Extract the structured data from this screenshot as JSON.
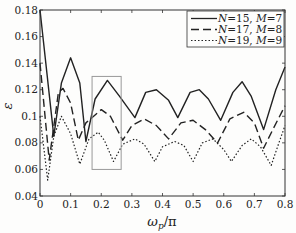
{
  "chart_data": {
    "type": "line",
    "title": "",
    "xlabel": "ω_p/π",
    "ylabel": "ε",
    "xlim": [
      0,
      0.8
    ],
    "ylim": [
      0.04,
      0.18
    ],
    "xticks": [
      0,
      0.1,
      0.2,
      0.3,
      0.4,
      0.5,
      0.6,
      0.7,
      0.8
    ],
    "xtick_labels": [
      "0",
      "0.1",
      "0.2",
      "0.3",
      "0.4",
      "0.5",
      "0.6",
      "0.7",
      "0.8"
    ],
    "yticks": [
      0.04,
      0.06,
      0.08,
      0.1,
      0.12,
      0.14,
      0.16,
      0.18
    ],
    "ytick_labels": [
      "0.04",
      "0.06",
      "0.08",
      "0.1",
      "0.12",
      "0.14",
      "0.16",
      "0.18"
    ],
    "grid": false,
    "legend_position": "upper right",
    "series": [
      {
        "name": "N=15, M=7",
        "style": "solid",
        "color": "#222222",
        "points": [
          [
            0,
            0.18
          ],
          [
            0.045,
            0.085
          ],
          [
            0.07,
            0.125
          ],
          [
            0.1,
            0.144
          ],
          [
            0.13,
            0.125
          ],
          [
            0.15,
            0.081
          ],
          [
            0.18,
            0.113
          ],
          [
            0.22,
            0.127
          ],
          [
            0.26,
            0.115
          ],
          [
            0.31,
            0.099
          ],
          [
            0.345,
            0.118
          ],
          [
            0.38,
            0.12
          ],
          [
            0.42,
            0.112
          ],
          [
            0.45,
            0.099
          ],
          [
            0.49,
            0.118
          ],
          [
            0.52,
            0.12
          ],
          [
            0.55,
            0.113
          ],
          [
            0.59,
            0.097
          ],
          [
            0.63,
            0.118
          ],
          [
            0.66,
            0.126
          ],
          [
            0.69,
            0.115
          ],
          [
            0.73,
            0.09
          ],
          [
            0.77,
            0.12
          ],
          [
            0.8,
            0.137
          ]
        ]
      },
      {
        "name": "N=17, M=8",
        "style": "dashed",
        "color": "#222222",
        "points": [
          [
            0,
            0.14
          ],
          [
            0.03,
            0.067
          ],
          [
            0.06,
            0.118
          ],
          [
            0.075,
            0.121
          ],
          [
            0.1,
            0.11
          ],
          [
            0.125,
            0.082
          ],
          [
            0.15,
            0.095
          ],
          [
            0.2,
            0.105
          ],
          [
            0.23,
            0.1
          ],
          [
            0.27,
            0.082
          ],
          [
            0.3,
            0.093
          ],
          [
            0.34,
            0.098
          ],
          [
            0.38,
            0.093
          ],
          [
            0.42,
            0.083
          ],
          [
            0.46,
            0.095
          ],
          [
            0.5,
            0.097
          ],
          [
            0.54,
            0.09
          ],
          [
            0.58,
            0.08
          ],
          [
            0.62,
            0.098
          ],
          [
            0.665,
            0.103
          ],
          [
            0.7,
            0.095
          ],
          [
            0.73,
            0.076
          ],
          [
            0.76,
            0.09
          ],
          [
            0.8,
            0.108
          ]
        ]
      },
      {
        "name": "N=19, M=9",
        "style": "dotted",
        "color": "#222222",
        "points": [
          [
            0,
            0.1
          ],
          [
            0.025,
            0.052
          ],
          [
            0.045,
            0.085
          ],
          [
            0.07,
            0.1
          ],
          [
            0.1,
            0.087
          ],
          [
            0.13,
            0.064
          ],
          [
            0.16,
            0.083
          ],
          [
            0.19,
            0.088
          ],
          [
            0.21,
            0.082
          ],
          [
            0.24,
            0.066
          ],
          [
            0.27,
            0.079
          ],
          [
            0.31,
            0.083
          ],
          [
            0.34,
            0.079
          ],
          [
            0.375,
            0.066
          ],
          [
            0.4,
            0.077
          ],
          [
            0.44,
            0.081
          ],
          [
            0.47,
            0.078
          ],
          [
            0.5,
            0.066
          ],
          [
            0.53,
            0.08
          ],
          [
            0.565,
            0.083
          ],
          [
            0.6,
            0.075
          ],
          [
            0.625,
            0.066
          ],
          [
            0.66,
            0.078
          ],
          [
            0.69,
            0.083
          ],
          [
            0.72,
            0.077
          ],
          [
            0.755,
            0.063
          ],
          [
            0.78,
            0.08
          ],
          [
            0.8,
            0.093
          ]
        ]
      }
    ],
    "annotations": [
      {
        "type": "rectangle",
        "x0": 0.17,
        "x1": 0.265,
        "y0": 0.06,
        "y1": 0.13,
        "color": "#999999"
      }
    ]
  },
  "legend": {
    "entries": [
      {
        "label_n": "N",
        "n_value": "=15, ",
        "label_m": "M",
        "m_value": "=7"
      },
      {
        "label_n": "N",
        "n_value": "=17, ",
        "label_m": "M",
        "m_value": "=8"
      },
      {
        "label_n": "N",
        "n_value": "=19, ",
        "label_m": "M",
        "m_value": "=9"
      }
    ]
  },
  "axis_titles": {
    "x_main": "ω",
    "x_sub": "p",
    "x_rest": "/π",
    "y": "ε"
  }
}
